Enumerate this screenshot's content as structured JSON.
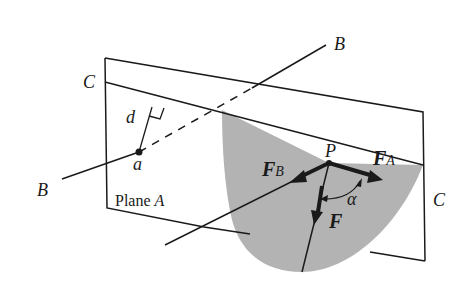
{
  "diagram": {
    "colors": {
      "line": "#1a1a1a",
      "shade": "#b3b3b3",
      "background": "#ffffff"
    },
    "labels": {
      "line_b_top": "B",
      "line_b_bottom": "B",
      "line_c_left": "C",
      "line_c_right": "C",
      "distance": "d",
      "point_a": "a",
      "point_p": "P",
      "plane": "Plane A",
      "force_b": "F",
      "force_b_sub": "B",
      "force_a": "F",
      "force_a_sub": "A",
      "force": "F",
      "angle": "α"
    }
  }
}
